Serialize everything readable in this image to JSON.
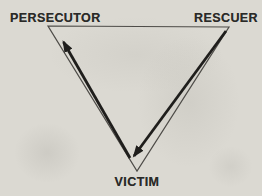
{
  "diagram": {
    "name": "drama-triangle",
    "nodes": {
      "persecutor": {
        "label": "PERSECUTOR",
        "position": "top-left"
      },
      "rescuer": {
        "label": "RESCUER",
        "position": "top-right"
      },
      "victim": {
        "label": "VICTIM",
        "position": "bottom"
      }
    },
    "arrows": [
      {
        "from": "rescuer",
        "to": "victim",
        "side": "right-edge"
      },
      {
        "from": "victim",
        "to": "persecutor",
        "side": "left-edge"
      }
    ],
    "colors": {
      "paper": "#dbd9d2",
      "outline": "#4e4c48",
      "ink": "#1f1e1c",
      "label": "#2a2a28"
    }
  }
}
